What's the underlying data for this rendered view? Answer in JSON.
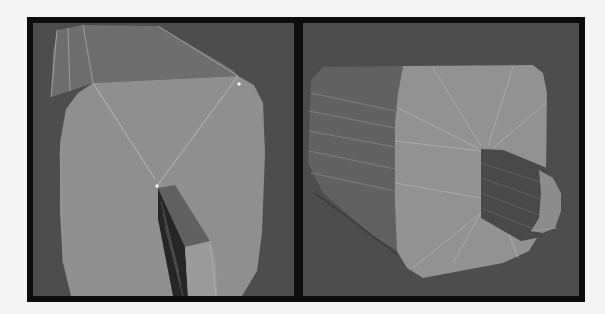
{
  "viewports": [
    {
      "id": "left",
      "label": "perspective view of extruded mesh, front-top angle",
      "background": "#4d4d4d",
      "face_color": "#8f8f8f",
      "top_face_color": "#6d6d6d",
      "inner_dark_color": "#2a2a2a",
      "inner_mid_color": "#5f5f5f",
      "edge_color": "#b8b8b8",
      "vertex_color": "#f2f2f2"
    },
    {
      "id": "right",
      "label": "perspective view of extruded mesh, side angle",
      "background": "#4d4d4d",
      "face_color": "#919191",
      "side_face_color": "#626262",
      "inner_dark_color": "#4a4a4a",
      "edge_color": "#b5b5b5"
    }
  ],
  "frame": {
    "border_color": "#0c0c0c"
  }
}
